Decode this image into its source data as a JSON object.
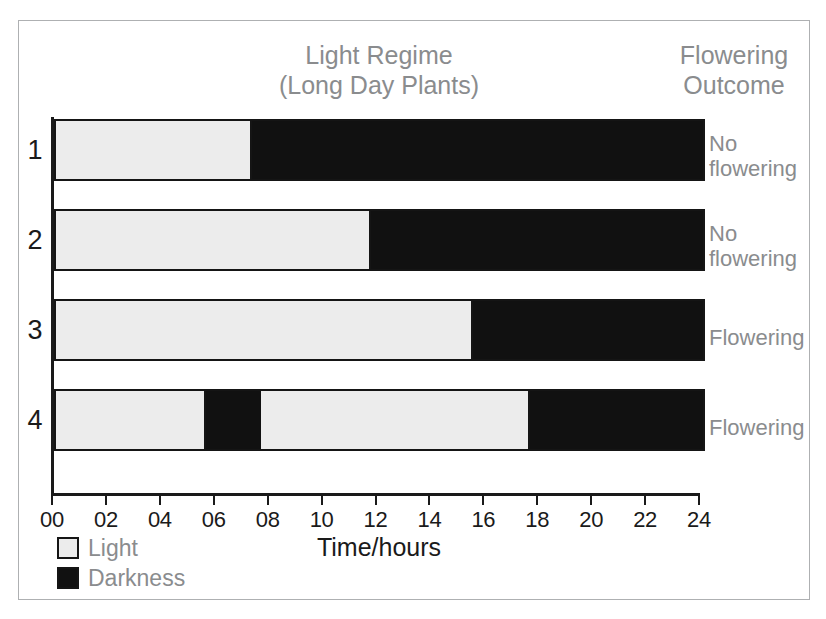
{
  "headings": {
    "regime": "Light Regime\n(Long Day Plants)",
    "outcome": "Flowering\nOutcome"
  },
  "axis": {
    "title": "Time/hours",
    "tick_labels": [
      "00",
      "02",
      "04",
      "06",
      "08",
      "10",
      "12",
      "14",
      "16",
      "18",
      "20",
      "22",
      "24"
    ],
    "min": 0,
    "max": 24
  },
  "legend": {
    "items": [
      {
        "label": "Light",
        "color": "#ececec"
      },
      {
        "label": "Darkness",
        "color": "#111111"
      }
    ]
  },
  "rows": [
    {
      "number": "1",
      "outcome": "No\nflowering"
    },
    {
      "number": "2",
      "outcome": "No\nflowering"
    },
    {
      "number": "3",
      "outcome": "Flowering"
    },
    {
      "number": "4",
      "outcome": "Flowering"
    }
  ],
  "chart_data": {
    "type": "bar",
    "title": "Light Regime (Long Day Plants)",
    "xlabel": "Time/hours",
    "ylabel": "",
    "xlim": [
      0,
      24
    ],
    "grid": false,
    "legend_position": "bottom-left",
    "categories": [
      "1",
      "2",
      "3",
      "4"
    ],
    "series": [
      {
        "name": "Treatment 1",
        "outcome": "No flowering",
        "segments": [
          {
            "type": "Light",
            "start": 0,
            "end": 7.2
          },
          {
            "type": "Darkness",
            "start": 7.2,
            "end": 24
          }
        ]
      },
      {
        "name": "Treatment 2",
        "outcome": "No flowering",
        "segments": [
          {
            "type": "Light",
            "start": 0,
            "end": 11.6
          },
          {
            "type": "Darkness",
            "start": 11.6,
            "end": 24
          }
        ]
      },
      {
        "name": "Treatment 3",
        "outcome": "Flowering",
        "segments": [
          {
            "type": "Light",
            "start": 0,
            "end": 15.4
          },
          {
            "type": "Darkness",
            "start": 15.4,
            "end": 24
          }
        ]
      },
      {
        "name": "Treatment 4",
        "outcome": "Flowering",
        "segments": [
          {
            "type": "Light",
            "start": 0,
            "end": 5.5
          },
          {
            "type": "Darkness",
            "start": 5.5,
            "end": 7.6
          },
          {
            "type": "Light",
            "start": 7.6,
            "end": 17.5
          },
          {
            "type": "Darkness",
            "start": 17.5,
            "end": 24
          }
        ]
      }
    ]
  }
}
